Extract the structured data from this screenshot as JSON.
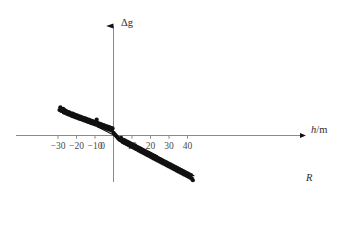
{
  "figure": {
    "axis_color": "#8a8a8a",
    "data_color": "#111111",
    "tick_label_color": "#4a4a4a",
    "y_axis_label": "Δg",
    "x_axis_label_var": "h",
    "x_axis_label_sep": "/",
    "x_axis_label_unit": "m",
    "regression_label": "R",
    "caption": ""
  },
  "chart_data": {
    "type": "scatter",
    "title": "",
    "xlabel": "h / m",
    "ylabel": "Δg",
    "grid": false,
    "legend": "none",
    "annotations": [
      {
        "text": "R",
        "x": 45.5,
        "y": -10.6,
        "note": "label for linear regression line"
      }
    ],
    "xlim": [
      -33,
      48
    ],
    "ylim": [
      -12,
      7
    ],
    "xticks": [
      -30,
      -20,
      -10,
      0,
      10,
      20,
      30,
      40
    ],
    "xtick_labels": [
      "−30",
      "−20",
      "−10",
      "0",
      "10",
      "20",
      "30",
      "40"
    ],
    "yticks": [],
    "ytick_labels": [],
    "series": [
      {
        "name": "measurements",
        "type": "scatter",
        "marker": "filled-circle",
        "marker_size": 2.1,
        "color": "#111111",
        "x": [
          -29.2,
          -28.7,
          -28.4,
          -28.1,
          -27.6,
          -27.2,
          -26.9,
          -26.4,
          -26.0,
          -25.6,
          -25.2,
          -24.8,
          -24.3,
          -23.9,
          -23.4,
          -23.0,
          -22.6,
          -22.1,
          -21.7,
          -21.2,
          -20.8,
          -20.3,
          -19.9,
          -19.4,
          -19.0,
          -18.5,
          -18.1,
          -17.6,
          -17.2,
          -16.7,
          -16.3,
          -15.8,
          -15.4,
          -14.9,
          -14.5,
          -14.0,
          -13.6,
          -13.1,
          -12.7,
          -12.2,
          -11.8,
          -11.3,
          -10.9,
          -10.4,
          -10.0,
          -9.5,
          -9.1,
          -8.6,
          -8.2,
          -7.7,
          -7.3,
          -6.8,
          -6.4,
          -5.9,
          -5.5,
          -5.0,
          -4.6,
          -4.1,
          -3.7,
          -3.2,
          -2.8,
          -2.3,
          -1.9,
          -1.4,
          -1.0,
          -0.5,
          0.0,
          0.5,
          1.0,
          1.5,
          2.0,
          2.5,
          3.0,
          3.6,
          4.1,
          4.6,
          5.1,
          5.6,
          6.1,
          6.6,
          7.2,
          7.7,
          8.2,
          8.7,
          9.2,
          9.7,
          10.3,
          10.8,
          11.3,
          11.8,
          12.3,
          12.8,
          13.4,
          13.9,
          14.4,
          14.9,
          15.4,
          15.9,
          16.5,
          17.0,
          17.5,
          18.0,
          18.5,
          19.1,
          19.6,
          20.1,
          20.6,
          21.1,
          21.6,
          22.2,
          22.7,
          23.2,
          23.7,
          24.2,
          24.8,
          25.3,
          25.8,
          26.3,
          26.8,
          27.3,
          27.9,
          28.4,
          28.9,
          29.4,
          29.9,
          30.5,
          31.0,
          31.5,
          32.0,
          32.5,
          33.0,
          33.6,
          34.1,
          34.6,
          35.1,
          35.6,
          36.2,
          36.7,
          37.2,
          37.7,
          38.2,
          38.7,
          39.3,
          39.8,
          40.3,
          40.8,
          41.3,
          41.9,
          42.4,
          42.9
        ],
        "y": [
          6.3,
          6.95,
          6.1,
          6.55,
          6.05,
          6.6,
          5.7,
          6.25,
          5.55,
          6.0,
          5.35,
          5.85,
          5.2,
          5.7,
          5.05,
          5.5,
          4.85,
          5.4,
          4.7,
          5.2,
          4.55,
          5.05,
          4.4,
          4.9,
          4.25,
          4.75,
          4.1,
          4.6,
          3.95,
          4.45,
          3.8,
          4.3,
          3.65,
          4.15,
          3.5,
          4.0,
          3.35,
          3.85,
          3.2,
          3.7,
          3.05,
          3.55,
          2.9,
          3.4,
          2.75,
          3.25,
          3.9,
          3.1,
          2.45,
          2.95,
          2.3,
          2.8,
          2.15,
          2.65,
          2.0,
          2.5,
          1.85,
          2.35,
          1.7,
          2.2,
          1.55,
          2.05,
          1.4,
          1.9,
          1.25,
          1.75,
          0.65,
          0.35,
          0.1,
          -0.15,
          -0.4,
          -0.65,
          -0.9,
          -1.15,
          -0.55,
          -1.4,
          -1.65,
          -1.05,
          -1.9,
          -1.3,
          -2.15,
          -1.55,
          -2.4,
          -1.8,
          -2.65,
          -2.05,
          -2.9,
          -2.3,
          -3.15,
          -2.55,
          -3.4,
          -2.8,
          -3.65,
          -3.05,
          -3.9,
          -3.3,
          -4.15,
          -3.55,
          -4.4,
          -3.8,
          -4.65,
          -4.05,
          -4.9,
          -4.3,
          -5.15,
          -4.55,
          -5.4,
          -4.8,
          -5.65,
          -5.05,
          -5.9,
          -5.3,
          -6.15,
          -5.55,
          -6.4,
          -5.8,
          -6.65,
          -6.05,
          -6.9,
          -6.3,
          -7.15,
          -6.55,
          -7.4,
          -6.8,
          -7.65,
          -7.05,
          -7.9,
          -7.3,
          -8.15,
          -7.55,
          -8.4,
          -7.8,
          -8.65,
          -8.05,
          -8.9,
          -8.3,
          -9.15,
          -8.55,
          -9.4,
          -8.8,
          -9.65,
          -9.05,
          -9.9,
          -9.3,
          -10.15,
          -9.55,
          -10.4,
          -9.8,
          -10.65,
          -11.05
        ]
      },
      {
        "name": "R",
        "type": "line",
        "color": "#111111",
        "line_width": 1.1,
        "fit": "linear",
        "slope": -0.2315,
        "intercept": 0.15,
        "x_start": -29.5,
        "x_end": 43.5
      }
    ]
  }
}
